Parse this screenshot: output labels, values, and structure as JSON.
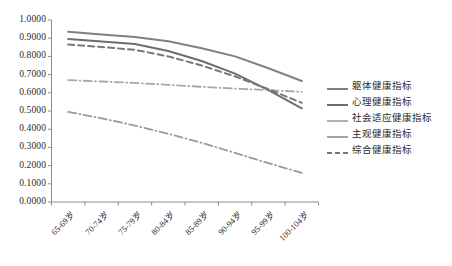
{
  "chart_data": {
    "type": "line",
    "title": "",
    "xlabel": "",
    "ylabel": "",
    "ylim": [
      0.0,
      1.0
    ],
    "ytick_step": 0.1,
    "grid": false,
    "legend_position": "right",
    "categories": [
      "65-69岁",
      "70-74岁",
      "75-79岁",
      "80-84岁",
      "85-89岁",
      "90-94岁",
      "95-99岁",
      "100-104岁"
    ],
    "ytick_labels": [
      "0.0000",
      "0.1000",
      "0.2000",
      "0.3000",
      "0.4000",
      "0.5000",
      "0.6000",
      "0.7000",
      "0.8000",
      "0.9000",
      "1.0000"
    ],
    "ytick_values": [
      0.0,
      0.1,
      0.2,
      0.3,
      0.4,
      0.5,
      0.6,
      0.7,
      0.8,
      0.9,
      1.0
    ],
    "series": [
      {
        "name": "躯体健康指标",
        "style": "solid",
        "color": "#808080",
        "width": 2.0,
        "values": [
          0.935,
          0.921,
          0.906,
          0.883,
          0.845,
          0.8,
          0.735,
          0.665
        ]
      },
      {
        "name": "心理健康指标",
        "style": "solid",
        "color": "#6e6e6e",
        "width": 2.0,
        "values": [
          0.895,
          0.882,
          0.868,
          0.83,
          0.775,
          0.705,
          0.615,
          0.515
        ]
      },
      {
        "name": "社会适应健康指标",
        "style": "dashdot",
        "color": "#a8a8a8",
        "width": 1.8,
        "values": [
          0.67,
          0.662,
          0.654,
          0.644,
          0.633,
          0.623,
          0.615,
          0.605
        ]
      },
      {
        "name": "主观健康指标",
        "style": "dashdot",
        "color": "#9a9a9a",
        "width": 1.8,
        "values": [
          0.495,
          0.46,
          0.42,
          0.375,
          0.325,
          0.27,
          0.213,
          0.16
        ]
      },
      {
        "name": "综合健康指标",
        "style": "dashed",
        "color": "#777777",
        "width": 2.0,
        "values": [
          0.865,
          0.852,
          0.836,
          0.8,
          0.75,
          0.69,
          0.62,
          0.545
        ]
      }
    ]
  },
  "legend": {
    "items": [
      {
        "label": "躯体健康指标"
      },
      {
        "label": "心理健康指标"
      },
      {
        "label": "社会适应健康指标"
      },
      {
        "label": "主观健康指标"
      },
      {
        "label": "综合健康指标"
      }
    ]
  },
  "colors": {
    "axis": "#8c8c8c",
    "text": "#2b2b2b",
    "background": "#ffffff"
  }
}
